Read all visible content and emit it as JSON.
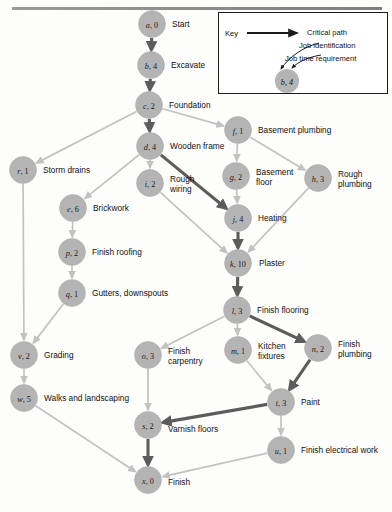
{
  "figure": {
    "type": "project-network-diagram",
    "title": "",
    "top_rule": true
  },
  "key": {
    "label": "Key",
    "critical_path_label": "Critical path",
    "job_identification_label": "Job identification",
    "job_time_label": "Job time requirement",
    "sample_node": "b, 4",
    "sample_node_letter": "b",
    "sample_node_time": "4"
  },
  "colors": {
    "node_fill": "#b4b4b4",
    "edge_normal": "#c2c2c2",
    "edge_critical": "#5c5c5c",
    "text": "#111111",
    "background": "#fdfdfc"
  },
  "chart_data": {
    "type": "diagram",
    "nodes": [
      {
        "id": "a",
        "label": "a, 0",
        "letter": "a",
        "time": "0",
        "name": "Start",
        "x": 152,
        "y": 24,
        "lx": 172,
        "ly": 24
      },
      {
        "id": "b",
        "label": "b, 4",
        "letter": "b",
        "time": "4",
        "name": "Excavate",
        "x": 151,
        "y": 65,
        "lx": 171,
        "ly": 65
      },
      {
        "id": "c",
        "label": "c, 2",
        "letter": "c",
        "time": "2",
        "name": "Foundation",
        "x": 149,
        "y": 105,
        "lx": 169,
        "ly": 105
      },
      {
        "id": "d",
        "label": "d, 4",
        "letter": "d",
        "time": "4",
        "name": "Wooden frame",
        "x": 150,
        "y": 146,
        "lx": 170,
        "ly": 146
      },
      {
        "id": "f",
        "label": "f, 1",
        "letter": "f",
        "time": "1",
        "name": "Basement plumbing",
        "x": 238,
        "y": 130,
        "lx": 258,
        "ly": 130
      },
      {
        "id": "r",
        "label": "r, 1",
        "letter": "r",
        "time": "1",
        "name": "Storm drains",
        "x": 23,
        "y": 170,
        "lx": 43,
        "ly": 170
      },
      {
        "id": "i",
        "label": "i, 2",
        "letter": "i",
        "time": "2",
        "name": "Rough\nwiring",
        "x": 150,
        "y": 183,
        "lx": 170,
        "ly": 179
      },
      {
        "id": "g",
        "label": "g, 2",
        "letter": "g",
        "time": "2",
        "name": "Basement\nfloor",
        "x": 236,
        "y": 176,
        "lx": 256,
        "ly": 172
      },
      {
        "id": "h",
        "label": "h, 3",
        "letter": "h",
        "time": "3",
        "name": "Rough\nplumbing",
        "x": 318,
        "y": 178,
        "lx": 338,
        "ly": 174
      },
      {
        "id": "e",
        "label": "e, 6",
        "letter": "e",
        "time": "6",
        "name": "Brickwork",
        "x": 73,
        "y": 208,
        "lx": 93,
        "ly": 208
      },
      {
        "id": "j",
        "label": "j, 4",
        "letter": "j",
        "time": "4",
        "name": "Heating",
        "x": 238,
        "y": 218,
        "lx": 258,
        "ly": 218
      },
      {
        "id": "p",
        "label": "p, 2",
        "letter": "p",
        "time": "2",
        "name": "Finish roofing",
        "x": 72,
        "y": 252,
        "lx": 92,
        "ly": 252
      },
      {
        "id": "k",
        "label": "k, 10",
        "letter": "k",
        "time": "10",
        "name": "Plaster",
        "x": 238,
        "y": 263,
        "lx": 259,
        "ly": 263
      },
      {
        "id": "q",
        "label": "q, 1",
        "letter": "q",
        "time": "1",
        "name": "Gutters, downspouts",
        "x": 72,
        "y": 293,
        "lx": 92,
        "ly": 293
      },
      {
        "id": "l",
        "label": "l, 3",
        "letter": "l",
        "time": "3",
        "name": "Finish flooring",
        "x": 237,
        "y": 310,
        "lx": 257,
        "ly": 310
      },
      {
        "id": "v",
        "label": "v, 2",
        "letter": "v",
        "time": "2",
        "name": "Grading",
        "x": 24,
        "y": 355,
        "lx": 44,
        "ly": 355
      },
      {
        "id": "o",
        "label": "o, 3",
        "letter": "o",
        "time": "3",
        "name": "Finish\ncarpentry",
        "x": 148,
        "y": 355,
        "lx": 168,
        "ly": 351
      },
      {
        "id": "m",
        "label": "m, 1",
        "letter": "m",
        "time": "1",
        "name": "Kitchen\nfixtures",
        "x": 238,
        "y": 350,
        "lx": 258,
        "ly": 346
      },
      {
        "id": "n",
        "label": "n, 2",
        "letter": "n",
        "time": "2",
        "name": "Finish\nplumbing",
        "x": 318,
        "y": 348,
        "lx": 338,
        "ly": 344
      },
      {
        "id": "w",
        "label": "w, 5",
        "letter": "w",
        "time": "5",
        "name": "Walks and landscaping",
        "x": 24,
        "y": 398,
        "lx": 44,
        "ly": 398
      },
      {
        "id": "t",
        "label": "t, 3",
        "letter": "t",
        "time": "3",
        "name": "Paint",
        "x": 281,
        "y": 402,
        "lx": 301,
        "ly": 402
      },
      {
        "id": "s",
        "label": "s, 2",
        "letter": "s",
        "time": "2",
        "name": "Varnish floors",
        "x": 148,
        "y": 425,
        "lx": 168,
        "ly": 429
      },
      {
        "id": "u",
        "label": "u, 1",
        "letter": "u",
        "time": "1",
        "name": "Finish electrical work",
        "x": 281,
        "y": 450,
        "lx": 301,
        "ly": 450
      },
      {
        "id": "x",
        "label": "x, 0",
        "letter": "x",
        "time": "0",
        "name": "Finish",
        "x": 148,
        "y": 480,
        "lx": 168,
        "ly": 482
      }
    ],
    "edges": [
      {
        "from": "a",
        "to": "b",
        "critical": true
      },
      {
        "from": "b",
        "to": "c",
        "critical": true
      },
      {
        "from": "c",
        "to": "d",
        "critical": true
      },
      {
        "from": "c",
        "to": "f",
        "critical": false
      },
      {
        "from": "c",
        "to": "r",
        "critical": false
      },
      {
        "from": "d",
        "to": "i",
        "critical": false
      },
      {
        "from": "d",
        "to": "e",
        "critical": false
      },
      {
        "from": "d",
        "to": "j",
        "critical": true
      },
      {
        "from": "f",
        "to": "g",
        "critical": false
      },
      {
        "from": "f",
        "to": "h",
        "critical": false
      },
      {
        "from": "g",
        "to": "j",
        "critical": false
      },
      {
        "from": "h",
        "to": "k",
        "critical": false
      },
      {
        "from": "i",
        "to": "k",
        "critical": false
      },
      {
        "from": "j",
        "to": "k",
        "critical": true
      },
      {
        "from": "e",
        "to": "p",
        "critical": false
      },
      {
        "from": "p",
        "to": "q",
        "critical": false
      },
      {
        "from": "q",
        "to": "v",
        "critical": false
      },
      {
        "from": "r",
        "to": "v",
        "critical": false
      },
      {
        "from": "k",
        "to": "l",
        "critical": true
      },
      {
        "from": "l",
        "to": "o",
        "critical": false
      },
      {
        "from": "l",
        "to": "m",
        "critical": false
      },
      {
        "from": "l",
        "to": "n",
        "critical": true
      },
      {
        "from": "v",
        "to": "w",
        "critical": false
      },
      {
        "from": "m",
        "to": "t",
        "critical": false
      },
      {
        "from": "n",
        "to": "t",
        "critical": true
      },
      {
        "from": "o",
        "to": "s",
        "critical": false
      },
      {
        "from": "t",
        "to": "s",
        "critical": true
      },
      {
        "from": "t",
        "to": "u",
        "critical": false
      },
      {
        "from": "s",
        "to": "x",
        "critical": true
      },
      {
        "from": "w",
        "to": "x",
        "critical": false
      },
      {
        "from": "u",
        "to": "x",
        "critical": false
      }
    ],
    "critical_path": [
      "a",
      "b",
      "c",
      "d",
      "j",
      "k",
      "l",
      "n",
      "t",
      "s",
      "x"
    ],
    "legend": {
      "position": "top-right"
    }
  }
}
